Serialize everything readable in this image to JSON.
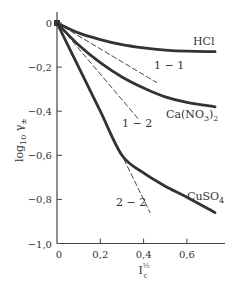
{
  "chart_data": {
    "type": "line",
    "title": "",
    "xlabel": "I_c^½",
    "ylabel": "log10 γ±",
    "xlim": [
      0,
      0.75
    ],
    "ylim": [
      -1.0,
      0.05
    ],
    "grid": false,
    "legend": "inline labels",
    "x_ticks": [
      0,
      0.2,
      0.4,
      0.6
    ],
    "x_tick_labels": [
      "0",
      "0,2",
      "0,4",
      "0,6"
    ],
    "y_ticks": [
      0,
      -0.2,
      -0.4,
      -0.6,
      -0.8,
      -1.0
    ],
    "y_tick_labels": [
      "0",
      "−0,2",
      "−0,4",
      "−0,6",
      "−0,8",
      "−1,0"
    ],
    "series": [
      {
        "name": "HCl",
        "style": "solid",
        "x": [
          0,
          0.1,
          0.2,
          0.3,
          0.4,
          0.5,
          0.6,
          0.73
        ],
        "y": [
          0,
          -0.045,
          -0.075,
          -0.098,
          -0.113,
          -0.123,
          -0.128,
          -0.13
        ]
      },
      {
        "name": "Ca(NO3)2",
        "label_main": "Ca(NO",
        "label_sub1": "3",
        "label_paren": ")",
        "label_sub2": "2",
        "style": "solid",
        "x": [
          0,
          0.1,
          0.2,
          0.3,
          0.4,
          0.5,
          0.6,
          0.73
        ],
        "y": [
          0,
          -0.1,
          -0.18,
          -0.245,
          -0.295,
          -0.335,
          -0.36,
          -0.38
        ]
      },
      {
        "name": "CuSO4",
        "label_main": "CuSO",
        "label_sub": "4",
        "style": "solid",
        "x": [
          0,
          0.1,
          0.2,
          0.3,
          0.4,
          0.5,
          0.6,
          0.73
        ],
        "y": [
          0,
          -0.2,
          -0.4,
          -0.6,
          -0.68,
          -0.74,
          -0.79,
          -0.86
        ]
      },
      {
        "name": "1-1",
        "label": "1 − 1",
        "style": "dashed",
        "x": [
          0,
          0.46
        ],
        "y": [
          0,
          -0.27
        ]
      },
      {
        "name": "1-2",
        "label": "1 − 2",
        "style": "dashed",
        "x": [
          0,
          0.38
        ],
        "y": [
          0,
          -0.44
        ]
      },
      {
        "name": "2-2",
        "label": "2 − 2",
        "style": "dashed",
        "x": [
          0,
          0.43
        ],
        "y": [
          0,
          -0.86
        ]
      }
    ]
  }
}
